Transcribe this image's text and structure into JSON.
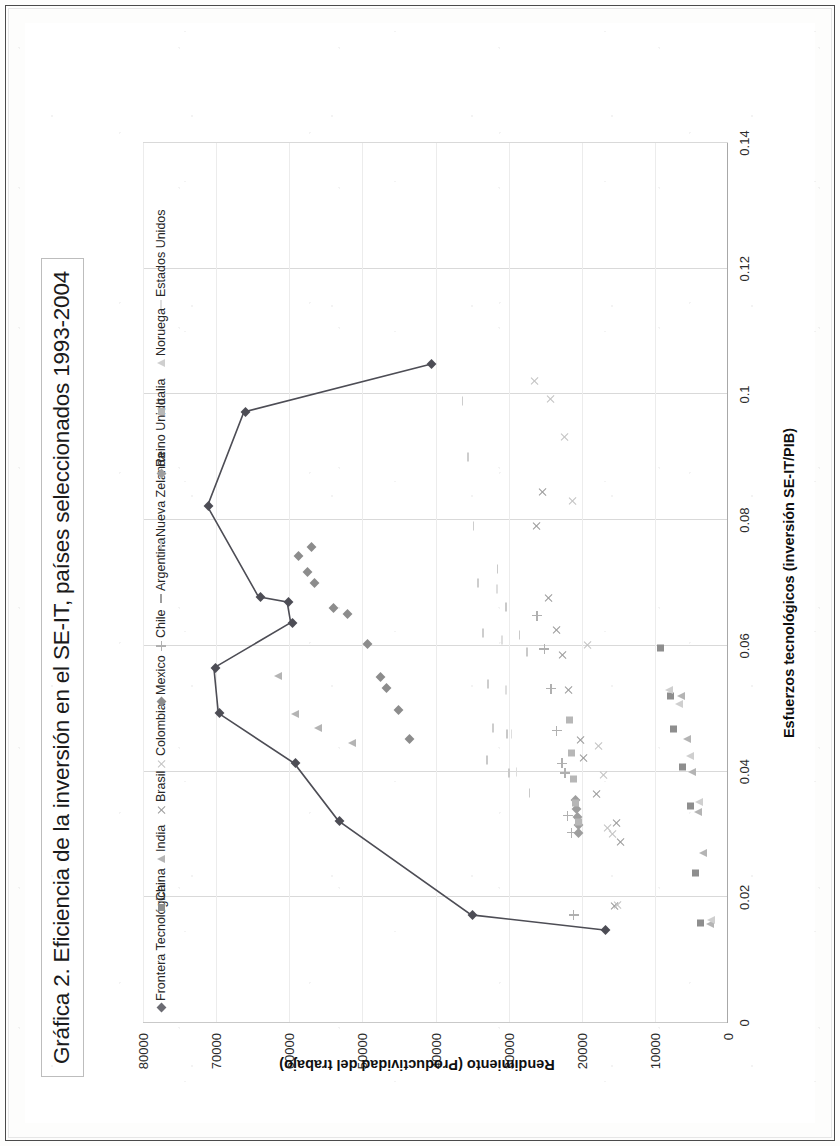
{
  "figure": {
    "title": "Gráfica 2. Eficiencia de la inversión en el SE-IT, países seleccionados 1993-2004"
  },
  "chart_data": {
    "type": "scatter",
    "title": "Gráfica 2. Eficiencia de la inversión en el SE-IT, países seleccionados 1993-2004",
    "xlabel": "Esfuerzos tecnológicos (inversión SE-IT/PIB)",
    "ylabel": "Rendimiento (Productividad del trabajo)",
    "xlim": [
      0,
      0.14
    ],
    "ylim": [
      0,
      80000
    ],
    "xticks": [
      "0",
      "0.02",
      "0.04",
      "0.06",
      "0.08",
      "0.1",
      "0.12",
      "0.14"
    ],
    "xtick_values": [
      0,
      0.02,
      0.04,
      0.06,
      0.08,
      0.1,
      0.12,
      0.14
    ],
    "yticks": [
      "0",
      "10000",
      "20000",
      "30000",
      "40000",
      "50000",
      "60000",
      "70000",
      "80000"
    ],
    "ytick_values": [
      0,
      10000,
      20000,
      30000,
      40000,
      50000,
      60000,
      70000,
      80000
    ],
    "grid": true,
    "legend_position": "top",
    "rotation_deg": -90,
    "series": [
      {
        "name": "Frontera Tecnológica",
        "marker": "diamond",
        "color": "#4d4d55",
        "line": true,
        "points": [
          [
            0.0148,
            16900
          ],
          [
            0.0172,
            35100
          ],
          [
            0.0322,
            53300
          ],
          [
            0.0413,
            59300
          ],
          [
            0.0493,
            69700
          ],
          [
            0.0565,
            70300
          ],
          [
            0.0637,
            59800
          ],
          [
            0.067,
            60300
          ],
          [
            0.0678,
            64200
          ],
          [
            0.0822,
            71200
          ],
          [
            0.0972,
            66200
          ],
          [
            0.1048,
            40700
          ]
        ]
      },
      {
        "name": "China",
        "marker": "square",
        "color": "#8e8e8e",
        "line": false,
        "points": [
          [
            0.0159,
            3900
          ],
          [
            0.0238,
            4600
          ],
          [
            0.0345,
            5400
          ],
          [
            0.0408,
            6400
          ],
          [
            0.0467,
            7600
          ],
          [
            0.052,
            8100
          ],
          [
            0.0596,
            9400
          ]
        ]
      },
      {
        "name": "India",
        "marker": "triangle",
        "color": "#b4b4b4",
        "line": false,
        "points": [
          [
            0.0157,
            2600
          ],
          [
            0.027,
            3500
          ],
          [
            0.0336,
            4300
          ],
          [
            0.04,
            5000
          ],
          [
            0.0452,
            5700
          ],
          [
            0.0521,
            6600
          ],
          [
            0.0445,
            51600
          ],
          [
            0.047,
            56200
          ],
          [
            0.0492,
            59400
          ],
          [
            0.0552,
            61700
          ]
        ]
      },
      {
        "name": "Brasil",
        "marker": "x",
        "color": "#9a9a9a",
        "line": false,
        "points": [
          [
            0.0186,
            15600
          ],
          [
            0.0288,
            14800
          ],
          [
            0.0318,
            15300
          ],
          [
            0.0364,
            18000
          ],
          [
            0.0422,
            19800
          ],
          [
            0.045,
            20300
          ],
          [
            0.053,
            21900
          ],
          [
            0.0585,
            22700
          ],
          [
            0.0626,
            23500
          ],
          [
            0.0676,
            24600
          ],
          [
            0.079,
            26300
          ],
          [
            0.0845,
            25400
          ]
        ]
      },
      {
        "name": "Colombia",
        "marker": "x",
        "color": "#c2c2c2",
        "line": false,
        "points": [
          [
            0.0188,
            15200
          ],
          [
            0.03,
            15900
          ],
          [
            0.031,
            16600
          ],
          [
            0.0394,
            17100
          ],
          [
            0.044,
            17800
          ],
          [
            0.0601,
            19300
          ],
          [
            0.083,
            21300
          ],
          [
            0.0932,
            22400
          ],
          [
            0.0992,
            24400
          ],
          [
            0.1022,
            26500
          ]
        ]
      },
      {
        "name": "Mexico",
        "marker": "diamond",
        "color": "#8c8c8c",
        "line": false,
        "points": [
          [
            0.0452,
            43800
          ],
          [
            0.0498,
            45300
          ],
          [
            0.0533,
            46900
          ],
          [
            0.055,
            47700
          ],
          [
            0.0603,
            49500
          ],
          [
            0.0651,
            52200
          ],
          [
            0.066,
            54200
          ],
          [
            0.07,
            56800
          ],
          [
            0.0718,
            57700
          ],
          [
            0.0743,
            58900
          ],
          [
            0.0758,
            57200
          ]
        ]
      },
      {
        "name": "Chile",
        "marker": "plus",
        "color": "#b0b0b0",
        "line": false,
        "points": [
          [
            0.0172,
            21100
          ],
          [
            0.0303,
            21400
          ],
          [
            0.033,
            21900
          ],
          [
            0.0398,
            22300
          ],
          [
            0.0413,
            22700
          ],
          [
            0.0465,
            23400
          ],
          [
            0.0532,
            24200
          ],
          [
            0.0595,
            25100
          ],
          [
            0.0648,
            26100
          ]
        ]
      },
      {
        "name": "Argentina",
        "marker": "dash",
        "color": "#c9c9c9",
        "line": false,
        "points": [
          [
            0.0366,
            27700
          ],
          [
            0.0397,
            30500
          ],
          [
            0.0418,
            33500
          ],
          [
            0.046,
            30800
          ],
          [
            0.059,
            28100
          ],
          [
            0.0618,
            29100
          ],
          [
            0.0662,
            30900
          ],
          [
            0.0722,
            32100
          ]
        ]
      },
      {
        "name": "Nueva Zelanda",
        "marker": "dash",
        "color": "#cdcdcd",
        "line": false,
        "points": [
          [
            0.047,
            32700
          ],
          [
            0.054,
            33400
          ],
          [
            0.062,
            34100
          ],
          [
            0.07,
            34800
          ],
          [
            0.079,
            35400
          ],
          [
            0.09,
            36100
          ],
          [
            0.099,
            36900
          ]
        ]
      },
      {
        "name": "Reino Unido",
        "marker": "diamond",
        "color": "#9e9e9e",
        "line": false,
        "points": [
          [
            0.0302,
            20600
          ],
          [
            0.0315,
            20700
          ],
          [
            0.0328,
            20800
          ],
          [
            0.0341,
            20900
          ],
          [
            0.0355,
            21000
          ]
        ]
      },
      {
        "name": "Italia",
        "marker": "square",
        "color": "#b7b7b7",
        "line": false,
        "points": [
          [
            0.032,
            20700
          ],
          [
            0.035,
            21000
          ],
          [
            0.0388,
            21300
          ],
          [
            0.043,
            21600
          ],
          [
            0.0482,
            21900
          ]
        ]
      },
      {
        "name": "Noruega",
        "marker": "triangle",
        "color": "#cfcfcf",
        "line": false,
        "points": [
          [
            0.0164,
            2500
          ],
          [
            0.0352,
            4100
          ],
          [
            0.0425,
            5300
          ],
          [
            0.0508,
            6900
          ],
          [
            0.0529,
            8200
          ]
        ]
      },
      {
        "name": "Estados Unidos",
        "marker": "dash",
        "color": "#dedede",
        "line": false,
        "points": [
          [
            0.04,
            29500
          ],
          [
            0.046,
            30200
          ],
          [
            0.053,
            30900
          ],
          [
            0.061,
            31500
          ],
          [
            0.069,
            32200
          ]
        ]
      }
    ]
  },
  "legend": {
    "items": [
      {
        "label": "Frontera Tecnológica",
        "marker": "diamond",
        "color": "#6b6b72"
      },
      {
        "label": "China",
        "marker": "square",
        "color": "#8e8e8e"
      },
      {
        "label": "India",
        "marker": "triangle",
        "color": "#b4b4b4"
      },
      {
        "label": "Brasil",
        "marker": "x",
        "color": "#9a9a9a"
      },
      {
        "label": "Colombia",
        "marker": "x",
        "color": "#c2c2c2"
      },
      {
        "label": "Mexico",
        "marker": "diamond",
        "color": "#8c8c8c"
      },
      {
        "label": "Chile",
        "marker": "plus",
        "color": "#b0b0b0"
      },
      {
        "label": "Argentina",
        "marker": "dash",
        "color": "#9d9d9d"
      },
      {
        "label": "Nueva Zelanda",
        "marker": "dash",
        "color": "#c9c9c9"
      },
      {
        "label": "Reino Unido",
        "marker": "diamond",
        "color": "#9e9e9e"
      },
      {
        "label": "Italia",
        "marker": "square",
        "color": "#b7b7b7"
      },
      {
        "label": "Noruega",
        "marker": "triangle",
        "color": "#cfcfcf"
      },
      {
        "label": "Estados Unidos",
        "marker": "dash",
        "color": "#dedede"
      }
    ]
  }
}
